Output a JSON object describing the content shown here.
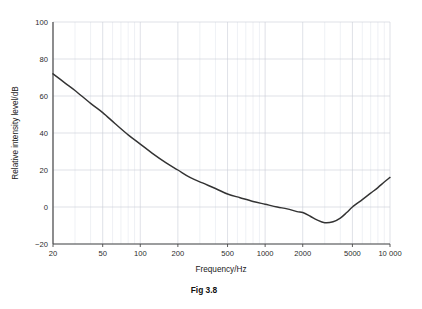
{
  "figure": {
    "caption": "Fig 3.8"
  },
  "chart_data": {
    "type": "line",
    "title": "",
    "subtitle": "",
    "xlabel": "Frequency/Hz",
    "ylabel": "Relative intensity level/dB",
    "xscale": "log",
    "yscale": "linear",
    "xlim": [
      20,
      10000
    ],
    "ylim": [
      -20,
      100
    ],
    "grid": true,
    "legend": null,
    "legend_position": "none",
    "annotations": [],
    "xticks": [
      20,
      50,
      100,
      200,
      500,
      1000,
      2000,
      5000,
      10000
    ],
    "xticklabels": [
      "20",
      "50",
      "100",
      "200",
      "500",
      "1000",
      "2000",
      "5000",
      "10 000"
    ],
    "yticks": [
      -20,
      0,
      20,
      40,
      60,
      80,
      100
    ],
    "yticklabels": [
      "−20",
      "0",
      "20",
      "40",
      "60",
      "80",
      "100"
    ],
    "series": [
      {
        "name": "Threshold of hearing",
        "color": "#333333",
        "x": [
          20,
          25,
          30,
          40,
          50,
          63,
          80,
          100,
          125,
          160,
          200,
          250,
          315,
          400,
          500,
          630,
          800,
          1000,
          1250,
          1500,
          1800,
          2000,
          2300,
          2600,
          3000,
          3500,
          4000,
          4500,
          5000,
          6000,
          7000,
          8000,
          9000,
          10000
        ],
        "y": [
          72,
          67,
          63,
          56,
          51,
          45,
          39,
          34,
          29,
          24,
          20,
          16,
          13,
          10,
          7,
          5,
          3,
          1.5,
          0,
          -1,
          -2.5,
          -3,
          -5,
          -7,
          -8.5,
          -8,
          -6,
          -3,
          0,
          4,
          7.5,
          10.5,
          13.5,
          16
        ]
      }
    ]
  },
  "axis_units": {
    "x_unit": "Hz",
    "y_unit": "dB"
  }
}
